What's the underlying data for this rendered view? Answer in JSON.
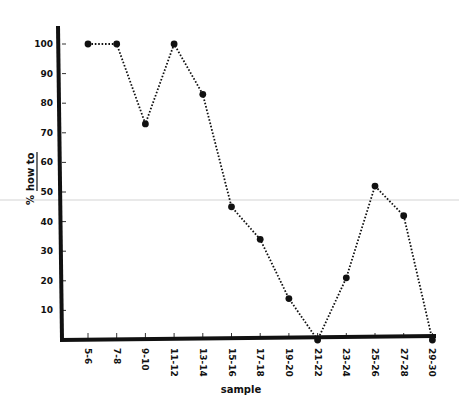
{
  "chart_data": {
    "type": "line",
    "title": "",
    "xlabel": "sample",
    "ylabel": "% how to",
    "categories": [
      "5-6",
      "7-8",
      "9-10",
      "11-12",
      "13-14",
      "15-16",
      "17-18",
      "19-20",
      "21-22",
      "23-24",
      "25-26",
      "27-28",
      "29-30"
    ],
    "series": [
      {
        "name": "% how to",
        "values": [
          100,
          100,
          73,
          100,
          83,
          45,
          34,
          14,
          0,
          21,
          52,
          42,
          0
        ]
      }
    ],
    "yticks": [
      10,
      20,
      30,
      40,
      50,
      60,
      70,
      80,
      90,
      100
    ],
    "ylim": [
      0,
      105
    ],
    "grid": false,
    "legend": null,
    "line_style": "dotted",
    "marker": "filled-circle",
    "colors": {
      "line": "#111111",
      "axis": "#111111",
      "background": "#ffffff"
    }
  },
  "labels": {
    "y_prefix": "%",
    "y_main": "how to",
    "x_title": "sample"
  }
}
